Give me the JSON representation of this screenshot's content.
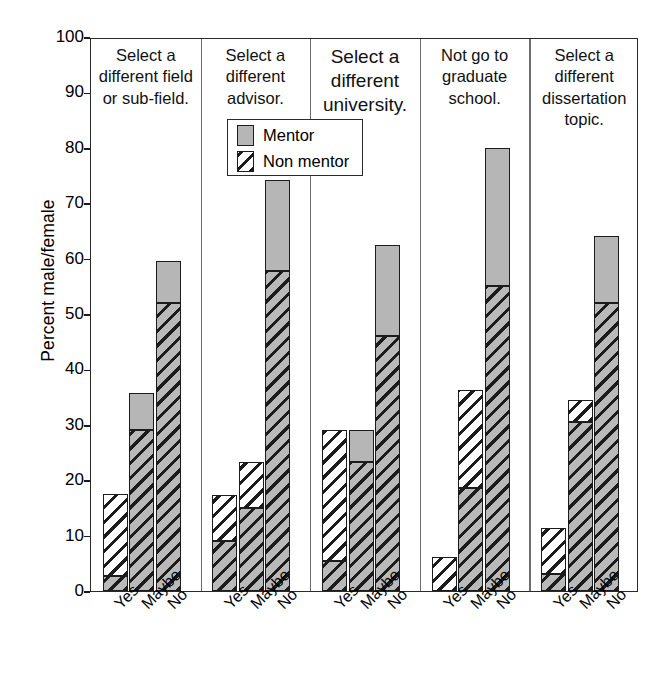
{
  "chart_data": {
    "type": "bar",
    "title": "",
    "xlabel": "",
    "ylabel": "Percent male/female",
    "ylim": [
      0,
      100
    ],
    "yticks": [
      0,
      10,
      20,
      30,
      40,
      50,
      60,
      70,
      80,
      90,
      100
    ],
    "grid": false,
    "stacked": true,
    "legend_position": "upper-center",
    "categories": [
      "Yes",
      "Maybe",
      "No"
    ],
    "legend": [
      "Mentor",
      "Non mentor"
    ],
    "colors": {
      "mentor": "#b6b6b6",
      "non_mentor": "#ffffff",
      "outline": "#1c1c1c"
    },
    "panels": [
      {
        "title": "Select a different field or sub-field.",
        "bars": [
          {
            "category": "Yes",
            "total": 17.5,
            "segments": [
              {
                "fill": "hatch-gray",
                "from": 0,
                "to": 2.8
              },
              {
                "fill": "hatch-white",
                "from": 2.8,
                "to": 17.5
              }
            ]
          },
          {
            "category": "Maybe",
            "total": 35.8,
            "segments": [
              {
                "fill": "hatch-gray",
                "from": 0,
                "to": 29.0
              },
              {
                "fill": "mentor",
                "from": 29.0,
                "to": 35.8
              }
            ]
          },
          {
            "category": "No",
            "total": 59.5,
            "segments": [
              {
                "fill": "hatch-gray",
                "from": 0,
                "to": 52.0
              },
              {
                "fill": "mentor",
                "from": 52.0,
                "to": 59.5
              }
            ]
          }
        ]
      },
      {
        "title": "Select a different advisor.",
        "bars": [
          {
            "category": "Yes",
            "total": 17.3,
            "segments": [
              {
                "fill": "hatch-gray",
                "from": 0,
                "to": 9.0
              },
              {
                "fill": "hatch-white",
                "from": 9.0,
                "to": 17.3
              }
            ]
          },
          {
            "category": "Maybe",
            "total": 23.3,
            "segments": [
              {
                "fill": "hatch-gray",
                "from": 0,
                "to": 15.0
              },
              {
                "fill": "hatch-white",
                "from": 15.0,
                "to": 23.3
              }
            ]
          },
          {
            "category": "No",
            "total": 74.2,
            "segments": [
              {
                "fill": "hatch-gray",
                "from": 0,
                "to": 57.8
              },
              {
                "fill": "mentor",
                "from": 57.8,
                "to": 74.2
              }
            ]
          }
        ]
      },
      {
        "title": "Select a different university.",
        "title_size": "big",
        "bars": [
          {
            "category": "Yes",
            "total": 29.0,
            "segments": [
              {
                "fill": "hatch-gray",
                "from": 0,
                "to": 5.5
              },
              {
                "fill": "hatch-white",
                "from": 5.5,
                "to": 29.0
              }
            ]
          },
          {
            "category": "Maybe",
            "total": 29.0,
            "segments": [
              {
                "fill": "hatch-gray",
                "from": 0,
                "to": 23.2
              },
              {
                "fill": "mentor",
                "from": 23.2,
                "to": 29.0
              }
            ]
          },
          {
            "category": "No",
            "total": 62.5,
            "segments": [
              {
                "fill": "hatch-gray",
                "from": 0,
                "to": 46.0
              },
              {
                "fill": "mentor",
                "from": 46.0,
                "to": 62.5
              }
            ]
          }
        ]
      },
      {
        "title": "Not go to graduate school.",
        "bars": [
          {
            "category": "Yes",
            "total": 6.2,
            "segments": [
              {
                "fill": "hatch-white",
                "from": 0,
                "to": 6.2
              }
            ]
          },
          {
            "category": "Maybe",
            "total": 36.3,
            "segments": [
              {
                "fill": "hatch-gray",
                "from": 0,
                "to": 18.6
              },
              {
                "fill": "hatch-white",
                "from": 18.6,
                "to": 36.3
              }
            ]
          },
          {
            "category": "No",
            "total": 80.0,
            "segments": [
              {
                "fill": "hatch-gray",
                "from": 0,
                "to": 55.0
              },
              {
                "fill": "mentor",
                "from": 55.0,
                "to": 80.0
              }
            ]
          }
        ]
      },
      {
        "title": "Select a different dissertation topic.",
        "bars": [
          {
            "category": "Yes",
            "total": 11.3,
            "segments": [
              {
                "fill": "hatch-gray",
                "from": 0,
                "to": 3.0
              },
              {
                "fill": "hatch-white",
                "from": 3.0,
                "to": 11.3
              }
            ]
          },
          {
            "category": "Maybe",
            "total": 34.5,
            "segments": [
              {
                "fill": "hatch-gray",
                "from": 0,
                "to": 30.5
              },
              {
                "fill": "hatch-white",
                "from": 30.5,
                "to": 34.5
              }
            ]
          },
          {
            "category": "No",
            "total": 64.0,
            "segments": [
              {
                "fill": "hatch-gray",
                "from": 0,
                "to": 52.0
              },
              {
                "fill": "mentor",
                "from": 52.0,
                "to": 64.0
              }
            ]
          }
        ]
      }
    ]
  }
}
